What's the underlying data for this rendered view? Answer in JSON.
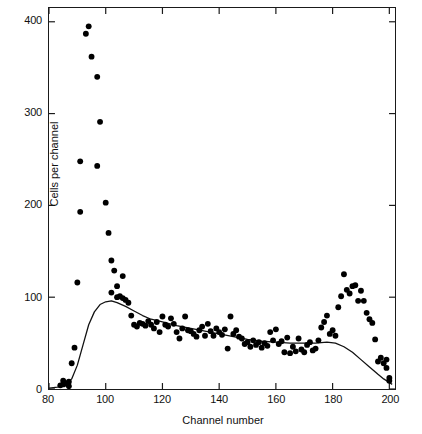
{
  "chart_data": {
    "type": "scatter",
    "title": "",
    "xlabel": "Channel number",
    "ylabel": "Cells per channel",
    "xlim": [
      80,
      202
    ],
    "ylim": [
      0,
      415
    ],
    "xticks": [
      80,
      100,
      120,
      140,
      160,
      180,
      200
    ],
    "yticks": [
      0,
      100,
      200,
      300,
      400
    ],
    "grid": false,
    "legend": null,
    "marker": {
      "shape": "circle",
      "color": "#000000",
      "size": 5
    },
    "series": [
      {
        "name": "Cells per channel",
        "kind": "scatter",
        "points": [
          [
            84,
            4
          ],
          [
            85,
            5
          ],
          [
            85,
            9
          ],
          [
            86,
            6
          ],
          [
            87,
            8
          ],
          [
            87,
            3
          ],
          [
            88,
            28
          ],
          [
            89,
            45
          ],
          [
            90,
            116
          ],
          [
            91,
            193
          ],
          [
            91,
            248
          ],
          [
            93,
            387
          ],
          [
            94,
            395
          ],
          [
            95,
            362
          ],
          [
            97,
            340
          ],
          [
            97,
            243
          ],
          [
            98,
            291
          ],
          [
            100,
            203
          ],
          [
            101,
            170
          ],
          [
            102,
            140
          ],
          [
            102,
            105
          ],
          [
            103,
            129
          ],
          [
            104,
            112
          ],
          [
            104,
            100
          ],
          [
            105,
            101
          ],
          [
            106,
            99
          ],
          [
            106,
            123
          ],
          [
            107,
            97
          ],
          [
            108,
            94
          ],
          [
            109,
            80
          ],
          [
            110,
            70
          ],
          [
            111,
            68
          ],
          [
            112,
            72
          ],
          [
            113,
            71
          ],
          [
            114,
            69
          ],
          [
            115,
            74
          ],
          [
            116,
            70
          ],
          [
            117,
            66
          ],
          [
            118,
            73
          ],
          [
            119,
            62
          ],
          [
            120,
            79
          ],
          [
            121,
            70
          ],
          [
            122,
            68
          ],
          [
            123,
            77
          ],
          [
            124,
            71
          ],
          [
            125,
            62
          ],
          [
            126,
            55
          ],
          [
            127,
            66
          ],
          [
            128,
            79
          ],
          [
            129,
            64
          ],
          [
            130,
            63
          ],
          [
            131,
            60
          ],
          [
            132,
            57
          ],
          [
            133,
            64
          ],
          [
            134,
            68
          ],
          [
            135,
            58
          ],
          [
            136,
            71
          ],
          [
            137,
            63
          ],
          [
            138,
            58
          ],
          [
            139,
            66
          ],
          [
            140,
            62
          ],
          [
            141,
            59
          ],
          [
            142,
            65
          ],
          [
            143,
            44
          ],
          [
            144,
            79
          ],
          [
            145,
            60
          ],
          [
            146,
            64
          ],
          [
            147,
            57
          ],
          [
            148,
            55
          ],
          [
            149,
            49
          ],
          [
            150,
            51
          ],
          [
            151,
            46
          ],
          [
            152,
            53
          ],
          [
            153,
            48
          ],
          [
            154,
            51
          ],
          [
            155,
            45
          ],
          [
            156,
            50
          ],
          [
            157,
            47
          ],
          [
            158,
            62
          ],
          [
            159,
            53
          ],
          [
            160,
            65
          ],
          [
            161,
            49
          ],
          [
            162,
            52
          ],
          [
            163,
            40
          ],
          [
            164,
            56
          ],
          [
            165,
            39
          ],
          [
            166,
            46
          ],
          [
            167,
            41
          ],
          [
            168,
            55
          ],
          [
            169,
            43
          ],
          [
            170,
            40
          ],
          [
            171,
            48
          ],
          [
            172,
            51
          ],
          [
            173,
            42
          ],
          [
            174,
            44
          ],
          [
            175,
            53
          ],
          [
            176,
            67
          ],
          [
            177,
            73
          ],
          [
            178,
            80
          ],
          [
            179,
            60
          ],
          [
            180,
            64
          ],
          [
            181,
            58
          ],
          [
            182,
            89
          ],
          [
            183,
            101
          ],
          [
            184,
            125
          ],
          [
            185,
            108
          ],
          [
            186,
            104
          ],
          [
            187,
            112
          ],
          [
            188,
            113
          ],
          [
            189,
            96
          ],
          [
            190,
            107
          ],
          [
            191,
            96
          ],
          [
            192,
            83
          ],
          [
            193,
            76
          ],
          [
            194,
            72
          ],
          [
            195,
            54
          ],
          [
            196,
            30
          ],
          [
            197,
            34
          ],
          [
            198,
            28
          ],
          [
            199,
            32
          ],
          [
            199,
            23
          ],
          [
            200,
            9
          ],
          [
            200,
            12
          ]
        ]
      },
      {
        "name": "fitted curve",
        "kind": "line",
        "color": "#111111",
        "points": [
          [
            80,
            1
          ],
          [
            83,
            2
          ],
          [
            86,
            5
          ],
          [
            88,
            11
          ],
          [
            90,
            26
          ],
          [
            92,
            48
          ],
          [
            94,
            70
          ],
          [
            96,
            84
          ],
          [
            98,
            92
          ],
          [
            100,
            95
          ],
          [
            102,
            96
          ],
          [
            104,
            94
          ],
          [
            107,
            90
          ],
          [
            110,
            85
          ],
          [
            113,
            80
          ],
          [
            116,
            76
          ],
          [
            120,
            73
          ],
          [
            125,
            69
          ],
          [
            130,
            66
          ],
          [
            135,
            63
          ],
          [
            140,
            60
          ],
          [
            145,
            57
          ],
          [
            150,
            54
          ],
          [
            155,
            52
          ],
          [
            160,
            51
          ],
          [
            165,
            50
          ],
          [
            170,
            50
          ],
          [
            174,
            50
          ],
          [
            178,
            51
          ],
          [
            181,
            50
          ],
          [
            184,
            46
          ],
          [
            187,
            40
          ],
          [
            190,
            32
          ],
          [
            193,
            24
          ],
          [
            196,
            16
          ],
          [
            198,
            11
          ],
          [
            200,
            7
          ],
          [
            201,
            5
          ]
        ]
      }
    ]
  },
  "axes": {
    "x_title": "Channel number",
    "y_title": "Cells per channel",
    "x_tick_labels": [
      "80",
      "100",
      "120",
      "140",
      "160",
      "180",
      "200"
    ],
    "y_tick_labels": [
      "0",
      "100",
      "200",
      "300",
      "400"
    ]
  }
}
